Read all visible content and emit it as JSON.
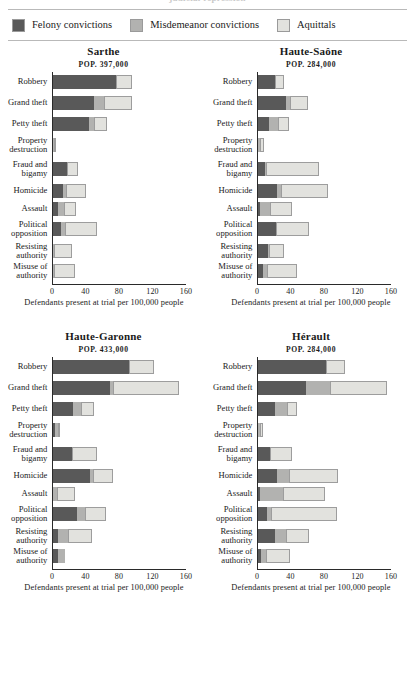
{
  "top_cutoff_title": "judicial repression",
  "legend": {
    "items": [
      {
        "label": "Felony convictions",
        "color": "#595959",
        "key": "felony"
      },
      {
        "label": "Misdemeanor convictions",
        "color": "#b2b2b0",
        "key": "misdemeanor"
      },
      {
        "label": "Aquittals",
        "color": "#e2e2de",
        "key": "acquittals"
      }
    ]
  },
  "axis": {
    "xlabel": "Defendants present at trial per 100,000 people",
    "ticks": [
      "0",
      "40",
      "80",
      "120",
      "160"
    ],
    "xlim": [
      0,
      160
    ]
  },
  "categories": [
    "Robbery",
    "Grand theft",
    "Petty theft",
    "Property destruction",
    "Fraud and bigamy",
    "Homicide",
    "Assault",
    "Political opposition",
    "Resisting authority",
    "Misuse of authority"
  ],
  "chart_data": {
    "type": "bar",
    "title": "",
    "xlabel": "Defendants present at trial per 100,000 people",
    "ylabel": "",
    "xlim": [
      0,
      160
    ],
    "grid": false,
    "legend_position": "top",
    "orientation": "horizontal",
    "stacked": true,
    "categories": [
      "Robbery",
      "Grand theft",
      "Petty theft",
      "Property destruction",
      "Fraud and bigamy",
      "Homicide",
      "Assault",
      "Political opposition",
      "Resisting authority",
      "Misuse of authority"
    ],
    "series_names": [
      "Felony convictions",
      "Misdemeanor convictions",
      "Aquittals"
    ],
    "panels": [
      {
        "name": "Sarthe",
        "population_label": "POP. 397,000",
        "population": 397000,
        "series": [
          {
            "name": "Felony convictions",
            "values": [
              75,
              48,
              43,
              0,
              16,
              11,
              6,
              9,
              0,
              0
            ]
          },
          {
            "name": "Misdemeanor convictions",
            "values": [
              0,
              13,
              5,
              1,
              0,
              4,
              7,
              5,
              1,
              1
            ]
          },
          {
            "name": "Aquittals",
            "values": [
              19,
              33,
              16,
              2,
              13,
              24,
              14,
              38,
              21,
              25
            ]
          }
        ],
        "totals": [
          94,
          94,
          64,
          3,
          29,
          39,
          27,
          52,
          22,
          26
        ]
      },
      {
        "name": "Haute-Saône",
        "population_label": "POP. 284,000",
        "population": 284000,
        "series": [
          {
            "name": "Felony convictions",
            "values": [
              20,
              33,
              13,
              0,
              8,
              22,
              2,
              21,
              11,
              5
            ]
          },
          {
            "name": "Misdemeanor convictions",
            "values": [
              0,
              5,
              10,
              2,
              1,
              5,
              12,
              0,
              2,
              5
            ]
          },
          {
            "name": "Aquittals",
            "values": [
              10,
              21,
              14,
              5,
              63,
              56,
              26,
              39,
              17,
              36
            ]
          }
        ],
        "totals": [
          30,
          59,
          37,
          7,
          72,
          83,
          40,
          60,
          30,
          46
        ]
      },
      {
        "name": "Haute-Garonne",
        "population_label": "POP. 433,000",
        "population": 433000,
        "series": [
          {
            "name": "Felony convictions",
            "values": [
              90,
              68,
              23,
              2,
              22,
              44,
              0,
              28,
              5,
              5
            ]
          },
          {
            "name": "Misdemeanor convictions",
            "values": [
              0,
              3,
              10,
              3,
              0,
              3,
              4,
              10,
              12,
              9
            ]
          },
          {
            "name": "Aquittals",
            "values": [
              30,
              79,
              16,
              3,
              30,
              24,
              22,
              25,
              29,
              0
            ]
          }
        ],
        "totals": [
          120,
          150,
          49,
          8,
          52,
          71,
          26,
          63,
          46,
          14
        ]
      },
      {
        "name": "Hérault",
        "population_label": "POP. 284,000",
        "population": 284000,
        "series": [
          {
            "name": "Felony convictions",
            "values": [
              81,
              57,
              20,
              0,
              14,
              22,
              2,
              10,
              20,
              3
            ]
          },
          {
            "name": "Misdemeanor convictions",
            "values": [
              0,
              28,
              14,
              2,
              0,
              14,
              27,
              5,
              13,
              6
            ]
          },
          {
            "name": "Aquittals",
            "values": [
              23,
              68,
              12,
              4,
              26,
              59,
              51,
              79,
              27,
              29
            ]
          }
        ],
        "totals": [
          104,
          153,
          46,
          6,
          40,
          95,
          80,
          94,
          60,
          38
        ]
      }
    ]
  }
}
